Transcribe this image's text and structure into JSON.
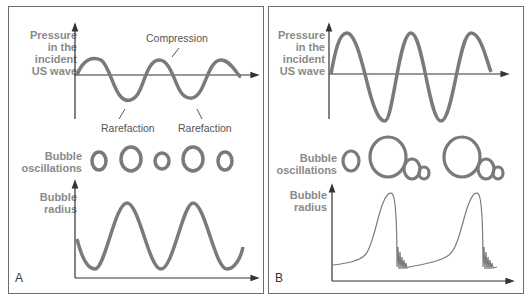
{
  "panels": [
    {
      "id": "A",
      "letter": "A",
      "pressure_label": [
        "Pressure",
        "in the",
        "incident",
        "US wave"
      ],
      "annotations": {
        "compression": "Compression",
        "rarefaction_1": "Rarefaction",
        "rarefaction_2": "Rarefaction"
      },
      "bubble_label": [
        "Bubble",
        "oscillations"
      ],
      "radius_label": [
        "Bubble",
        "radius"
      ]
    },
    {
      "id": "B",
      "letter": "B",
      "pressure_label": [
        "Pressure",
        "in the",
        "incident",
        "US wave"
      ],
      "bubble_label": [
        "Bubble",
        "oscillations"
      ],
      "radius_label": [
        "Bubble",
        "radius"
      ]
    }
  ],
  "colors": {
    "curve": "#7a7a7a",
    "axis": "#333333",
    "label": "#8a8a8a",
    "border": "#6e6e6e"
  }
}
